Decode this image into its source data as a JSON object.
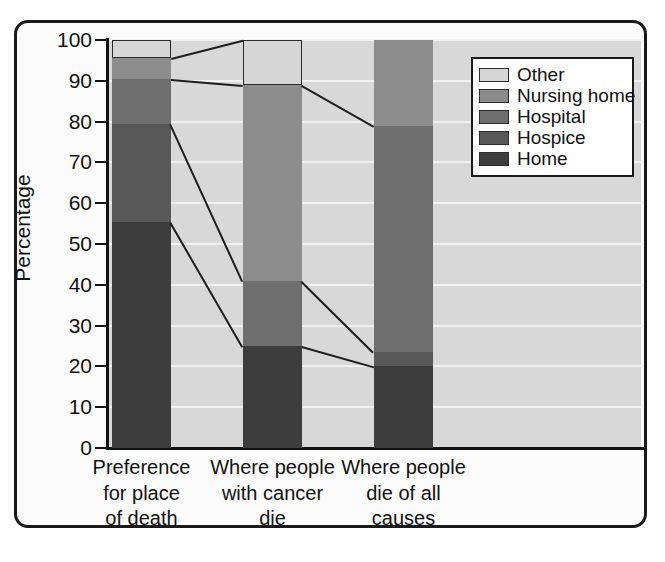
{
  "chart_data": {
    "type": "bar",
    "subtype": "stacked-bar-with-connectors",
    "title": "",
    "xlabel": "",
    "ylabel": "Percentage",
    "ylim": [
      0,
      100
    ],
    "yticks": [
      0,
      10,
      20,
      30,
      40,
      50,
      60,
      70,
      80,
      90,
      100
    ],
    "ytick_labels": [
      "0",
      "10",
      "20",
      "30",
      "40",
      "50",
      "60",
      "70",
      "80",
      "90",
      "100"
    ],
    "grid": true,
    "grid_orientation": "horizontal",
    "legend_position": "top-right",
    "categories": [
      "Preference for place of death",
      "Where people with cancer die",
      "Where people die of all causes"
    ],
    "category_label_lines": [
      [
        "Preference",
        "for place",
        "of death"
      ],
      [
        "Where people",
        "with cancer",
        "die"
      ],
      [
        "Where people",
        "die of all",
        "causes"
      ]
    ],
    "series": [
      {
        "name": "Home",
        "color": "#3d3d3d",
        "values": [
          55.5,
          25.0,
          20.0
        ]
      },
      {
        "name": "Hospice",
        "color": "#585858",
        "values": [
          24.0,
          0.0,
          3.5
        ]
      },
      {
        "name": "Hospital",
        "color": "#6e6e6e",
        "values": [
          11.0,
          16.0,
          55.5
        ]
      },
      {
        "name": "Nursing home",
        "color": "#8c8c8c",
        "values": [
          5.0,
          48.0,
          21.0
        ]
      },
      {
        "name": "Other",
        "color": "#d6d6d6",
        "values": [
          4.5,
          11.0,
          0.0
        ]
      }
    ],
    "cumulative_boundaries": [
      [
        55.5,
        79.5,
        90.5,
        95.5,
        100.0
      ],
      [
        25.0,
        25.0,
        41.0,
        89.0,
        100.0
      ],
      [
        20.0,
        23.5,
        79.0,
        100.0,
        100.0
      ]
    ],
    "legend_order_top_to_bottom": [
      "Other",
      "Nursing home",
      "Hospital",
      "Hospice",
      "Home"
    ],
    "connector_lines": [
      {
        "from_bar": 1,
        "to_bar": 2,
        "from_value": 55.5,
        "to_value": 25.0
      },
      {
        "from_bar": 1,
        "to_bar": 2,
        "from_value": 79.5,
        "to_value": 41.0
      },
      {
        "from_bar": 1,
        "to_bar": 2,
        "from_value": 90.5,
        "to_value": 89.0
      },
      {
        "from_bar": 1,
        "to_bar": 2,
        "from_value": 95.5,
        "to_value": 100.0
      },
      {
        "from_bar": 2,
        "to_bar": 3,
        "from_value": 25.0,
        "to_value": 20.0
      },
      {
        "from_bar": 2,
        "to_bar": 3,
        "from_value": 41.0,
        "to_value": 23.5
      },
      {
        "from_bar": 2,
        "to_bar": 3,
        "from_value": 89.0,
        "to_value": 79.0
      }
    ]
  },
  "axis": {
    "ylabel": "Percentage",
    "ticks": [
      "100",
      "90",
      "80",
      "70",
      "60",
      "50",
      "40",
      "30",
      "20",
      "10",
      "0"
    ]
  },
  "legend": {
    "items": [
      {
        "label": "Other",
        "color": "#d6d6d6"
      },
      {
        "label": "Nursing home",
        "color": "#8c8c8c"
      },
      {
        "label": "Hospital",
        "color": "#6e6e6e"
      },
      {
        "label": "Hospice",
        "color": "#585858"
      },
      {
        "label": "Home",
        "color": "#3d3d3d"
      }
    ]
  },
  "categories": [
    {
      "lines": [
        "Preference",
        "for place",
        "of death"
      ]
    },
    {
      "lines": [
        "Where people",
        "with cancer",
        "die"
      ]
    },
    {
      "lines": [
        "Where people",
        "die of all",
        "causes"
      ]
    }
  ]
}
